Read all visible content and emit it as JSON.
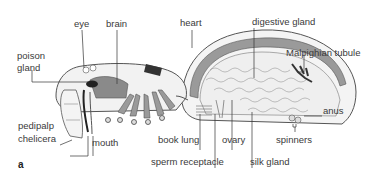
{
  "figure": {
    "panel_label": "a",
    "labels": {
      "eye": "eye",
      "brain": "brain",
      "heart": "heart",
      "digestive_gland": "digestive gland",
      "malpighian_tubule": "Malpighian tubule",
      "poison_gland_1": "poison",
      "poison_gland_2": "gland",
      "pedipalp": "pedipalp",
      "chelicera": "chelicera",
      "mouth": "mouth",
      "book_lung": "book lung",
      "ovary": "ovary",
      "spinners": "spinners",
      "anus": "anus",
      "sperm_receptacle": "sperm receptacle",
      "silk_gland": "silk gland"
    },
    "colors": {
      "outline": "#555555",
      "dark_fill": "#6e6e6e",
      "mid_fill": "#a8a8a8",
      "light_fill": "#e4e4e4",
      "leader_line": "#333333"
    }
  }
}
